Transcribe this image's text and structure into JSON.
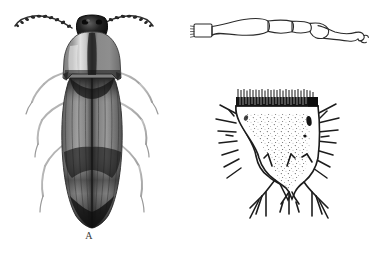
{
  "figure": {
    "background_color": "#ffffff",
    "ink_color": "#1a1a1a",
    "panel_count": 3,
    "labels": {
      "a": "A",
      "b": "B",
      "c": "C"
    },
    "panels": [
      {
        "key": "a",
        "label": "A",
        "caption_label": "A",
        "subject": "adult click beetle, dorsal view",
        "render_style": "halftone-shaded-drawing",
        "parts": [
          "head",
          "compound-eyes",
          "serrate-antennae",
          "pronotum",
          "pronotal-median-stripe",
          "elytra",
          "elytral-striae",
          "dark-elytral-bands",
          "legs",
          "tarsi"
        ]
      },
      {
        "key": "b",
        "label": "B",
        "caption_label": "B",
        "subject": "leg: femur, tibia and tarsus with claw",
        "render_style": "outline-line-drawing",
        "parts": [
          "coxa",
          "trochanter",
          "femur",
          "tibia",
          "tarsomeres",
          "tarsal-claw"
        ]
      },
      {
        "key": "c",
        "label": "C",
        "caption_label": "C",
        "subject": "wireworm larva terminal (caudal) segment",
        "render_style": "stippled-outline-drawing",
        "parts": [
          "anterior-dark-comb-band",
          "stippled-disc",
          "lateral-setae",
          "caudal-notch",
          "terminal-lobes",
          "apical-spines"
        ]
      }
    ]
  }
}
